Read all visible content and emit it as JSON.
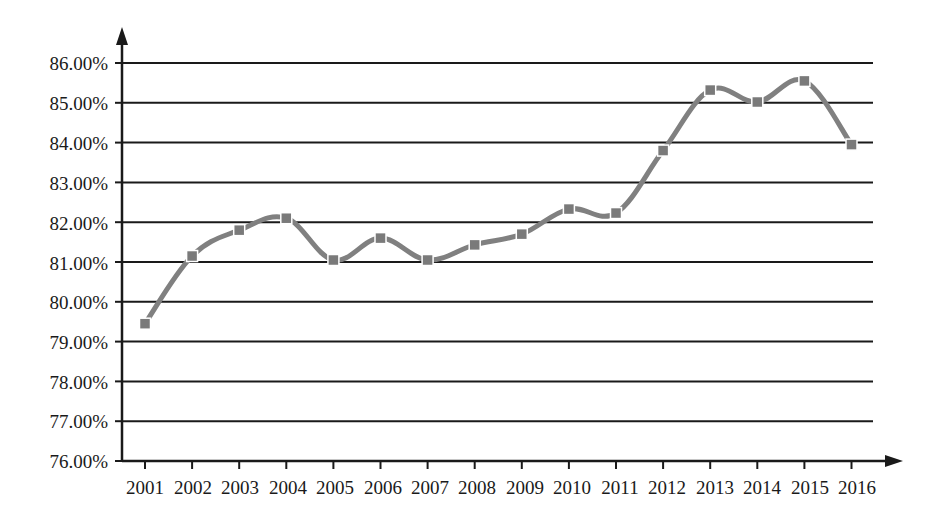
{
  "chart_data": {
    "type": "line",
    "title": "",
    "subtitle": "",
    "xlabel": "",
    "ylabel": "",
    "categories": [
      "2001",
      "2002",
      "2003",
      "2004",
      "2005",
      "2006",
      "2007",
      "2008",
      "2009",
      "2010",
      "2011",
      "2012",
      "2013",
      "2014",
      "2015",
      "2016"
    ],
    "values": [
      79.45,
      81.15,
      81.8,
      82.1,
      81.05,
      81.6,
      81.05,
      81.43,
      81.7,
      82.33,
      82.23,
      83.8,
      85.32,
      85.02,
      85.55,
      83.95
    ],
    "series": [
      {
        "name": "",
        "values": [
          79.45,
          81.15,
          81.8,
          82.1,
          81.05,
          81.6,
          81.05,
          81.43,
          81.7,
          82.33,
          82.23,
          83.8,
          85.32,
          85.02,
          85.55,
          83.95
        ]
      }
    ],
    "ylim": [
      76.0,
      86.0
    ],
    "ytick_labels": [
      "86.00%",
      "85.00%",
      "84.00%",
      "83.00%",
      "82.00%",
      "81.00%",
      "80.00%",
      "79.00%",
      "78.00%",
      "77.00%",
      "76.00%"
    ],
    "ytick_values": [
      86,
      85,
      84,
      83,
      82,
      81,
      80,
      79,
      78,
      77,
      76
    ],
    "xtick_labels": [
      "2001",
      "2002",
      "2003",
      "2004",
      "2005",
      "2006",
      "2007",
      "2008",
      "2009",
      "2010",
      "2011",
      "2012",
      "2013",
      "2014",
      "2015",
      "2016"
    ],
    "grid": "horizontal",
    "legend": "none",
    "value_format": "percent-2dp",
    "colors": {
      "series_line": "#808080",
      "marker": "#7a7a7a",
      "axis": "#1a1a1a",
      "gridline": "#1a1a1a",
      "background": "#ffffff",
      "text": "#1a1a1a"
    },
    "marker_shape": "square",
    "line_width": 5,
    "axis_arrows": [
      "y-up",
      "x-right"
    ]
  }
}
